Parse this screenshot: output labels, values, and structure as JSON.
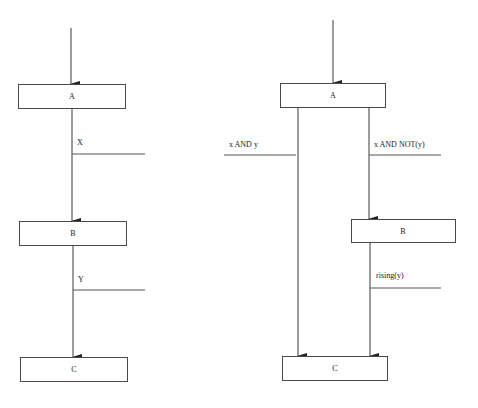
{
  "left_diagram": {
    "states": [
      {
        "id": "A",
        "label": "A"
      },
      {
        "id": "B",
        "label": "B"
      },
      {
        "id": "C",
        "label": "C"
      }
    ],
    "transitions": [
      {
        "from": "A",
        "to": "B",
        "condition": "X"
      },
      {
        "from": "B",
        "to": "C",
        "condition": "Y"
      }
    ]
  },
  "right_diagram": {
    "states": [
      {
        "id": "A",
        "label": "A"
      },
      {
        "id": "B",
        "label": "B"
      },
      {
        "id": "C",
        "label": "C"
      }
    ],
    "transitions": [
      {
        "from": "A",
        "to": "C",
        "condition": "x AND y"
      },
      {
        "from": "A",
        "to": "B",
        "condition": "x AND NOT(y)"
      },
      {
        "from": "B",
        "to": "C",
        "condition": "rising(y)"
      }
    ]
  },
  "colors": {
    "line": "#3a3a3a",
    "box_border": "#4a4a4a",
    "text": "#222222",
    "background": "#ffffff"
  }
}
